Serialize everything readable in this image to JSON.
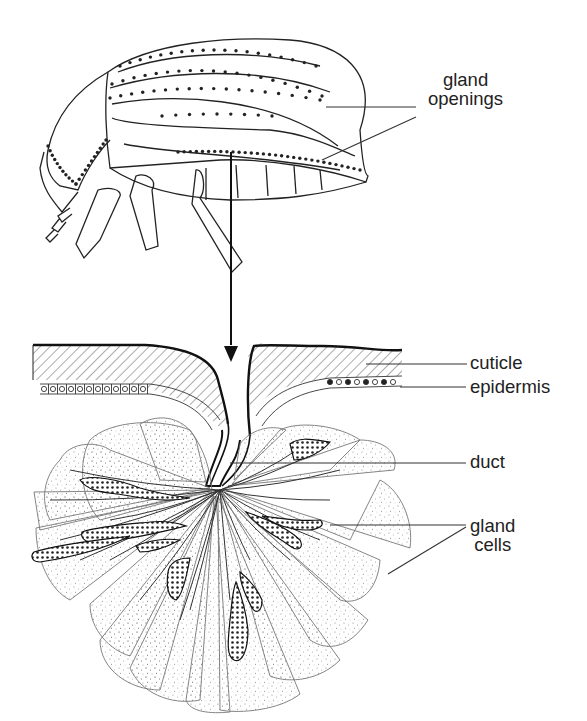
{
  "figure": {
    "colors": {
      "line": "#222222",
      "stipple": "#9a9a9a",
      "background": "#ffffff"
    }
  },
  "labels": {
    "gland_openings": {
      "line1": "gland",
      "line2": "openings"
    },
    "cuticle": "cuticle",
    "epidermis": "epidermis",
    "duct": "duct",
    "gland_cells": {
      "line1": "gland",
      "line2": "cells"
    }
  }
}
